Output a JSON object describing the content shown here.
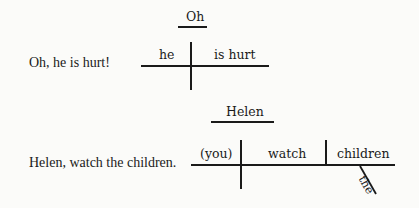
{
  "examples": [
    {
      "sentence": "Oh, he is hurt!",
      "diagram": {
        "interjection": "Oh",
        "subject": "he",
        "predicate": "is hurt"
      }
    },
    {
      "sentence": "Helen, watch the children.",
      "diagram": {
        "address": "Helen",
        "subject": "(you)",
        "verb": "watch",
        "object": "children",
        "modifier": "the"
      }
    }
  ]
}
